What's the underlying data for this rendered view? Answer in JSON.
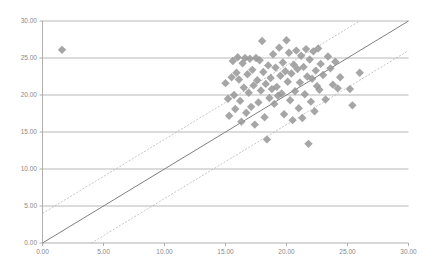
{
  "chart_data": {
    "type": "scatter",
    "title": "",
    "subtitle": "",
    "xlabel": "",
    "ylabel": "",
    "xlim": [
      0,
      30
    ],
    "ylim": [
      0,
      30
    ],
    "xticks": [
      0,
      5,
      10,
      15,
      20,
      25,
      30
    ],
    "yticks": [
      0,
      5,
      10,
      15,
      20,
      25,
      30
    ],
    "xtick_labels": [
      "0.00",
      "5.00",
      "10.00",
      "15.00",
      "20.00",
      "25.00",
      "30.00"
    ],
    "ytick_labels": [
      "0.00",
      "5.00",
      "10.00",
      "15.00",
      "20.00",
      "25.00",
      "30.00"
    ],
    "grid": {
      "horizontal": true,
      "vertical": false,
      "color": "#a6a6a6"
    },
    "legend": {
      "visible": false,
      "position": "none"
    },
    "marker": {
      "shape": "diamond",
      "color": "#969696",
      "size": 4.2
    },
    "series": [
      {
        "name": "observations",
        "points": [
          [
            1.6,
            26.1
          ],
          [
            15.0,
            21.6
          ],
          [
            15.2,
            19.5
          ],
          [
            15.3,
            17.2
          ],
          [
            15.5,
            22.4
          ],
          [
            15.6,
            24.6
          ],
          [
            15.7,
            20.0
          ],
          [
            15.8,
            18.1
          ],
          [
            15.9,
            23.0
          ],
          [
            16.0,
            25.1
          ],
          [
            16.1,
            22.1
          ],
          [
            16.2,
            19.2
          ],
          [
            16.3,
            16.4
          ],
          [
            16.4,
            24.3
          ],
          [
            16.5,
            21.0
          ],
          [
            16.6,
            25.0
          ],
          [
            16.7,
            17.6
          ],
          [
            16.8,
            22.8
          ],
          [
            16.9,
            20.3
          ],
          [
            17.0,
            24.9
          ],
          [
            17.1,
            18.4
          ],
          [
            17.2,
            23.4
          ],
          [
            17.3,
            21.3
          ],
          [
            17.4,
            16.0
          ],
          [
            17.5,
            25.0
          ],
          [
            17.6,
            22.0
          ],
          [
            17.7,
            19.0
          ],
          [
            17.8,
            24.7
          ],
          [
            17.9,
            20.6
          ],
          [
            18.0,
            27.3
          ],
          [
            18.1,
            23.1
          ],
          [
            18.2,
            17.0
          ],
          [
            18.3,
            21.5
          ],
          [
            18.4,
            14.0
          ],
          [
            18.5,
            24.0
          ],
          [
            18.6,
            19.6
          ],
          [
            18.7,
            22.3
          ],
          [
            18.8,
            20.8
          ],
          [
            18.9,
            25.5
          ],
          [
            19.0,
            18.8
          ],
          [
            19.1,
            23.7
          ],
          [
            19.2,
            21.1
          ],
          [
            19.3,
            19.9
          ],
          [
            19.4,
            26.4
          ],
          [
            19.5,
            22.6
          ],
          [
            19.6,
            20.2
          ],
          [
            19.7,
            24.4
          ],
          [
            19.8,
            17.4
          ],
          [
            19.9,
            23.2
          ],
          [
            20.0,
            27.4
          ],
          [
            20.1,
            21.8
          ],
          [
            20.2,
            25.7
          ],
          [
            20.3,
            19.3
          ],
          [
            20.4,
            22.9
          ],
          [
            20.5,
            16.6
          ],
          [
            20.6,
            24.1
          ],
          [
            20.7,
            20.5
          ],
          [
            20.8,
            26.0
          ],
          [
            20.9,
            23.5
          ],
          [
            21.0,
            18.2
          ],
          [
            21.1,
            21.7
          ],
          [
            21.2,
            25.3
          ],
          [
            21.3,
            16.9
          ],
          [
            21.4,
            23.8
          ],
          [
            21.5,
            20.1
          ],
          [
            21.6,
            26.2
          ],
          [
            21.7,
            22.5
          ],
          [
            21.8,
            13.4
          ],
          [
            21.9,
            24.8
          ],
          [
            22.0,
            19.1
          ],
          [
            22.1,
            22.2
          ],
          [
            22.2,
            25.9
          ],
          [
            22.3,
            17.8
          ],
          [
            22.4,
            23.3
          ],
          [
            22.5,
            21.2
          ],
          [
            22.6,
            26.3
          ],
          [
            22.7,
            20.7
          ],
          [
            22.8,
            24.2
          ],
          [
            23.0,
            22.7
          ],
          [
            23.2,
            19.4
          ],
          [
            23.4,
            25.2
          ],
          [
            23.6,
            23.6
          ],
          [
            23.8,
            21.4
          ],
          [
            24.0,
            24.5
          ],
          [
            24.2,
            20.9
          ],
          [
            24.4,
            22.4
          ],
          [
            25.2,
            20.8
          ],
          [
            25.4,
            18.6
          ],
          [
            26.0,
            23.0
          ]
        ]
      }
    ],
    "lines": [
      {
        "name": "identity-line",
        "style": "solid",
        "color": "#808080",
        "x0": 0,
        "y0": 0,
        "x1": 30,
        "y1": 30
      },
      {
        "name": "upper-confidence-line",
        "style": "dashed",
        "color": "#b8b8b8",
        "x0": 0,
        "y0": 4.0,
        "x1": 26.0,
        "y1": 30.0
      },
      {
        "name": "lower-confidence-line",
        "style": "dashed",
        "color": "#b8b8b8",
        "x0": 4.0,
        "y0": 0,
        "x1": 30.0,
        "y1": 26.0
      }
    ]
  }
}
